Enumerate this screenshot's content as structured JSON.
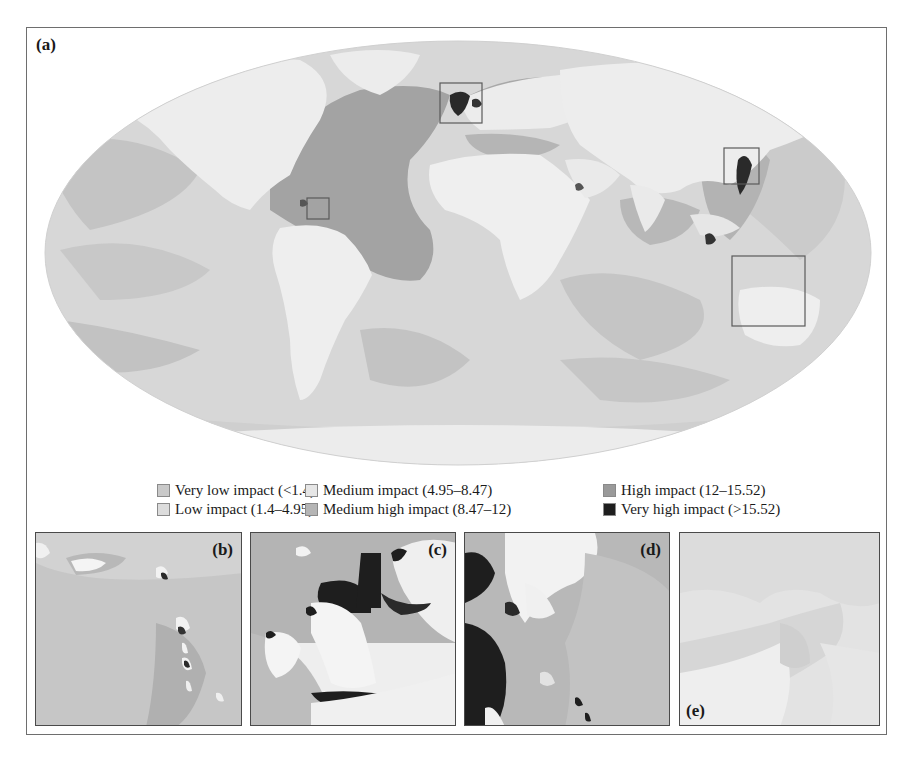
{
  "figure": {
    "panel_a_label": "(a)",
    "map_projection": "Mollweide world map",
    "inset_boxes": [
      {
        "target": "b",
        "region": "Caribbean"
      },
      {
        "target": "c",
        "region": "North Sea / British Isles"
      },
      {
        "target": "d",
        "region": "East Asia / Japan"
      },
      {
        "target": "e",
        "region": "Western Pacific / Papua"
      }
    ]
  },
  "legend": {
    "items": [
      {
        "label": "Very low impact (<1.4)",
        "color": "#c9c9c9"
      },
      {
        "label": "Low impact (1.4–4.95)",
        "color": "#dcdcdc"
      },
      {
        "label": "Medium impact (4.95–8.47)",
        "color": "#e6e6e6"
      },
      {
        "label": "Medium high impact (8.47–12)",
        "color": "#b5b5b5"
      },
      {
        "label": "High impact (12–15.52)",
        "color": "#9a9a9a"
      },
      {
        "label": "Very high impact (>15.52)",
        "color": "#1e1e1e"
      }
    ]
  },
  "insets": [
    {
      "label": "(b)"
    },
    {
      "label": "(c)"
    },
    {
      "label": "(d)"
    },
    {
      "label": "(e)"
    }
  ],
  "colors": {
    "land": "#efefef",
    "ocean_very_low": "#c9c9c9",
    "ocean_low": "#dcdcdc",
    "ocean_medium": "#e2e2e2",
    "ocean_medium_high": "#b5b5b5",
    "ocean_high": "#9a9a9a",
    "ocean_very_high": "#1e1e1e",
    "frame": "#6e6e6e"
  }
}
